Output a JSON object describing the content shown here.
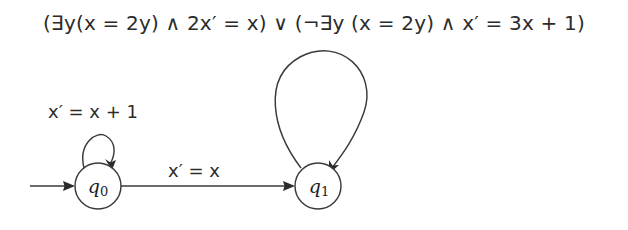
{
  "formula": {
    "text": "(∃y(x = 2y) ∧ 2x′ = x) ∨ (¬∃y (x = 2y) ∧ x′ = 3x + 1)"
  },
  "automaton": {
    "states": [
      {
        "id": "q0",
        "name": "q",
        "subscript": "0",
        "cx": 98,
        "cy": 186,
        "r": 23
      },
      {
        "id": "q1",
        "name": "q",
        "subscript": "1",
        "cx": 318,
        "cy": 186,
        "r": 23
      }
    ],
    "start_arrow": {
      "label": ""
    },
    "transitions": [
      {
        "id": "q0-self",
        "from": "q0",
        "to": "q0",
        "label": "x′ = x + 1"
      },
      {
        "id": "q0-q1",
        "from": "q0",
        "to": "q1",
        "label": "x′ = x"
      },
      {
        "id": "q1-self",
        "from": "q1",
        "to": "q1",
        "label": ""
      }
    ]
  },
  "colors": {
    "background": "#ffffff",
    "stroke": "#3a3a3a",
    "text": "#2b2b2b"
  }
}
